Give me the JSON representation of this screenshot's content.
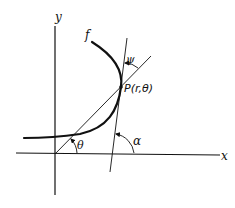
{
  "diagram": {
    "type": "polar-curve-tangent-angle",
    "colors": {
      "ink": "#111111",
      "background": "#ffffff"
    },
    "axes": {
      "x_label": "x",
      "y_label": "y"
    },
    "curve": {
      "label": "f"
    },
    "point": {
      "label": "P(r,θ)"
    },
    "angles": {
      "theta": "θ",
      "alpha": "α",
      "psi": "ψ"
    }
  }
}
